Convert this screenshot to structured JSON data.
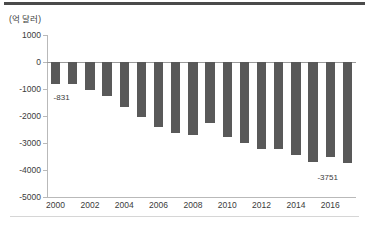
{
  "chart_data": {
    "type": "bar",
    "title": "",
    "subtitle": "",
    "unit_label": "(억 달러)",
    "xlabel": "",
    "ylabel": "",
    "ylim": [
      -5000,
      1000
    ],
    "yticks": [
      1000,
      0,
      -1000,
      -2000,
      -3000,
      -4000,
      -5000
    ],
    "ytick_labels": [
      "1000",
      "0",
      "-1000",
      "-2000",
      "-3000",
      "-4000",
      "-5000"
    ],
    "xticks": [
      2000,
      2002,
      2004,
      2006,
      2008,
      2010,
      2012,
      2014,
      2016
    ],
    "xtick_labels": [
      "2000",
      "2002",
      "2004",
      "2006",
      "2008",
      "2010",
      "2012",
      "2014",
      "2016"
    ],
    "grid": false,
    "legend": "none",
    "bar_color": "#595959",
    "categories": [
      "2000",
      "2001",
      "2002",
      "2003",
      "2004",
      "2005",
      "2006",
      "2007",
      "2008",
      "2009",
      "2010",
      "2011",
      "2012",
      "2013",
      "2014",
      "2015",
      "2016",
      "2017"
    ],
    "values": [
      -831,
      -830,
      -1020,
      -1265,
      -1665,
      -2040,
      -2390,
      -2620,
      -2700,
      -2265,
      -2760,
      -2985,
      -3220,
      -3225,
      -3430,
      -3715,
      -3500,
      -3751
    ],
    "annotations": [
      {
        "category": "2000",
        "value": -831,
        "text": "-831"
      },
      {
        "category": "2017",
        "value": -3751,
        "text": "-3751"
      }
    ]
  }
}
